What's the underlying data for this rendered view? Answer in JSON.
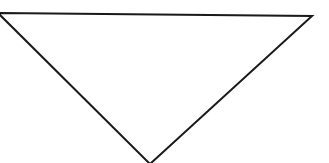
{
  "diagram": {
    "shape": "inverted-triangle",
    "stroke_color": "#1a1a1a",
    "fill_color": "#ffffff",
    "stroke_width": 2,
    "vertices": {
      "top_left": [
        -2,
        13
      ],
      "top_right": [
        312,
        16
      ],
      "bottom": [
        150,
        164
      ]
    }
  }
}
